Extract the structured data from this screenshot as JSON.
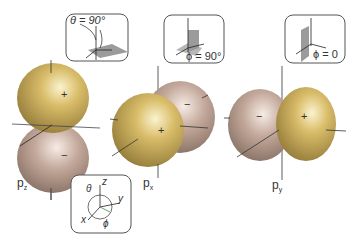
{
  "diagram": {
    "orbitals": [
      {
        "id": "pz",
        "label": "p",
        "subscript": "z",
        "positive_lobe": "+",
        "negative_lobe": "−",
        "orientation": "vertical"
      },
      {
        "id": "px",
        "label": "p",
        "subscript": "x",
        "positive_lobe": "+",
        "negative_lobe": "−",
        "orientation": "front-back"
      },
      {
        "id": "py",
        "label": "p",
        "subscript": "y",
        "positive_lobe": "+",
        "negative_lobe": "−",
        "orientation": "left-right"
      }
    ],
    "insets": [
      {
        "id": "theta-inset",
        "text": "θ = 90°"
      },
      {
        "id": "phi90-inset",
        "text": "ϕ = 90°"
      },
      {
        "id": "phi0-inset",
        "text": "ϕ = 0"
      }
    ],
    "axes_inset": {
      "z": "z",
      "y": "y",
      "x": "x",
      "theta": "θ",
      "phi": "ϕ"
    },
    "colors": {
      "positive_lobe": "#c8a84e",
      "negative_lobe": "#b89c8c",
      "inset_border": "#555555",
      "plane": "#8a8a8a"
    }
  }
}
